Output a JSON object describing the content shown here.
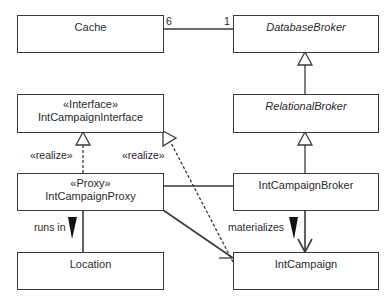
{
  "diagram": {
    "type": "UML class diagram",
    "classes": [
      {
        "id": "cache",
        "name": "Cache",
        "stereotype": null,
        "abstract": false
      },
      {
        "id": "database_broker",
        "name": "DatabaseBroker",
        "stereotype": null,
        "abstract": true
      },
      {
        "id": "interface",
        "name": "IntCampaignInterface",
        "stereotype": "«Interface»",
        "abstract": false
      },
      {
        "id": "relational_broker",
        "name": "RelationalBroker",
        "stereotype": null,
        "abstract": true
      },
      {
        "id": "proxy",
        "name": "IntCampaignProxy",
        "stereotype": "«Proxy»",
        "abstract": false
      },
      {
        "id": "campaign_broker",
        "name": "IntCampaignBroker",
        "stereotype": null,
        "abstract": false
      },
      {
        "id": "location",
        "name": "Location",
        "stereotype": null,
        "abstract": false
      },
      {
        "id": "campaign",
        "name": "IntCampaign",
        "stereotype": null,
        "abstract": false
      }
    ],
    "relationships": [
      {
        "from": "cache",
        "to": "database_broker",
        "kind": "association",
        "from_multiplicity": "6",
        "to_multiplicity": "1"
      },
      {
        "from": "relational_broker",
        "to": "database_broker",
        "kind": "generalization"
      },
      {
        "from": "campaign_broker",
        "to": "relational_broker",
        "kind": "generalization"
      },
      {
        "from": "proxy",
        "to": "interface",
        "kind": "realization",
        "label": "«realize»"
      },
      {
        "from": "campaign",
        "to": "interface",
        "kind": "realization",
        "label": "«realize»"
      },
      {
        "from": "proxy",
        "to": "location",
        "kind": "association",
        "label": "runs in"
      },
      {
        "from": "campaign_broker",
        "to": "campaign",
        "kind": "directed association",
        "label": "materializes"
      },
      {
        "from": "proxy",
        "to": "campaign_broker",
        "kind": "association"
      },
      {
        "from": "proxy",
        "to": "campaign",
        "kind": "directed association"
      }
    ],
    "labels": {
      "mult_cache": "6",
      "mult_db": "1",
      "realize_left": "«realize»",
      "realize_right": "«realize»",
      "runs_in": "runs in",
      "materializes": "materializes"
    },
    "colors": {
      "line": "#3a3a3a",
      "background": "#ffffff"
    }
  }
}
